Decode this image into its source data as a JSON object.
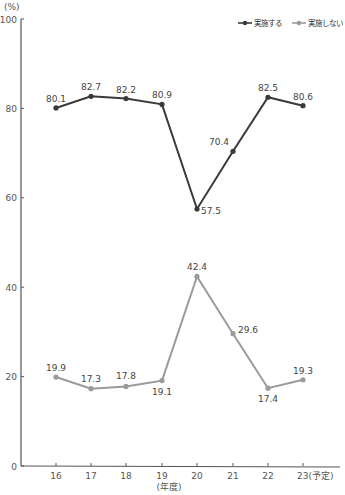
{
  "chart_data": {
    "type": "line",
    "title": "",
    "xlabel": "(年度)",
    "ylabel": "(%)",
    "ylim": [
      0,
      100
    ],
    "yticks": [
      0,
      20,
      40,
      60,
      80,
      100
    ],
    "categories": [
      "16",
      "17",
      "18",
      "19",
      "20",
      "21",
      "22",
      "23(予定)"
    ],
    "series": [
      {
        "name": "実施する",
        "color": "#3a3a3a",
        "values": [
          80.1,
          82.7,
          82.2,
          80.9,
          57.5,
          70.4,
          82.5,
          80.6
        ]
      },
      {
        "name": "実施しない",
        "color": "#9a9a9a",
        "values": [
          19.9,
          17.3,
          17.8,
          19.1,
          42.4,
          29.6,
          17.4,
          19.3
        ]
      }
    ],
    "legend_position": "top-right",
    "grid": false
  }
}
